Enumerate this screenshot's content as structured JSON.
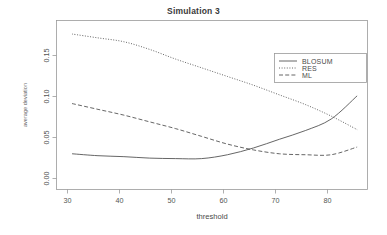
{
  "chart_data": {
    "type": "line",
    "title": "Simulation 3",
    "xlabel": "threshold",
    "ylabel": "average deviation",
    "xlim": [
      27,
      87
    ],
    "ylim": [
      0.0,
      0.175
    ],
    "xticks": [
      30,
      40,
      50,
      60,
      70,
      80
    ],
    "xtick_labels": [
      "30",
      "40",
      "50",
      "60",
      "70",
      "80"
    ],
    "yticks": [
      0.0,
      0.05,
      0.1,
      0.15
    ],
    "ytick_labels": [
      "0.00",
      "0.05",
      "0.10",
      "0.15"
    ],
    "grid": false,
    "legend_position": "top-right",
    "x": [
      30,
      35,
      40,
      45,
      50,
      55,
      60,
      65,
      70,
      75,
      80,
      85
    ],
    "series": [
      {
        "name": "BLOSUM",
        "linestyle": "solid",
        "color": "#555555",
        "values": [
          0.037,
          0.035,
          0.034,
          0.0325,
          0.032,
          0.032,
          0.036,
          0.043,
          0.052,
          0.061,
          0.073,
          0.097
        ]
      },
      {
        "name": "RES",
        "linestyle": "dotted",
        "color": "#555555",
        "values": [
          0.161,
          0.157,
          0.153,
          0.145,
          0.135,
          0.126,
          0.117,
          0.108,
          0.098,
          0.088,
          0.076,
          0.062
        ]
      },
      {
        "name": "ML",
        "linestyle": "dashed",
        "color": "#555555",
        "values": [
          0.089,
          0.083,
          0.077,
          0.07,
          0.063,
          0.055,
          0.047,
          0.041,
          0.037,
          0.036,
          0.036,
          0.044
        ]
      }
    ]
  },
  "legend": {
    "entries": [
      {
        "label": "BLOSUM",
        "style": "solid"
      },
      {
        "label": "RES",
        "style": "dotted"
      },
      {
        "label": "ML",
        "style": "dashed"
      }
    ]
  }
}
